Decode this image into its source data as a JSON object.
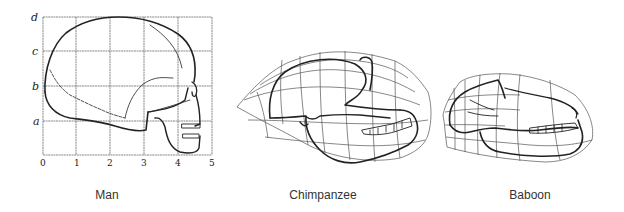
{
  "figure": {
    "panels": [
      {
        "id": "man",
        "caption": "Man",
        "caption_x": 107
      },
      {
        "id": "chimpanzee",
        "caption": "Chimpanzee",
        "caption_x": 323
      },
      {
        "id": "baboon",
        "caption": "Baboon",
        "caption_x": 530
      }
    ],
    "man_grid": {
      "x_ticks": [
        "0",
        "1",
        "2",
        "3",
        "4",
        "5"
      ],
      "y_ticks": [
        "d",
        "c",
        "b",
        "a"
      ]
    }
  }
}
